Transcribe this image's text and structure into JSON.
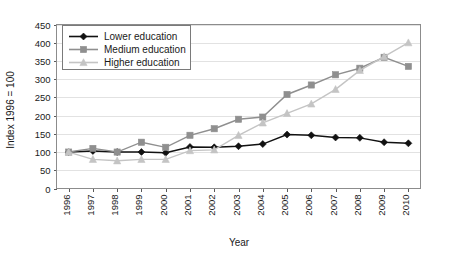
{
  "chart_data": {
    "type": "line",
    "title": "",
    "xlabel": "Year",
    "ylabel": "Index 1996 = 100",
    "categories": [
      "1996",
      "1997",
      "1998",
      "1999",
      "2000",
      "2001",
      "2002",
      "2003",
      "2004",
      "2005",
      "2006",
      "2007",
      "2008",
      "2009",
      "2010"
    ],
    "x": [
      1996,
      1997,
      1998,
      1999,
      2000,
      2001,
      2002,
      2003,
      2004,
      2005,
      2006,
      2007,
      2008,
      2009,
      2010
    ],
    "ylim": [
      0,
      450
    ],
    "yticks": [
      0,
      50,
      100,
      150,
      200,
      250,
      300,
      350,
      400,
      450
    ],
    "grid": true,
    "legend_position": "top-left",
    "series": [
      {
        "name": "Lower education",
        "color": "#111111",
        "marker": "diamond",
        "values": [
          100,
          103,
          100,
          100,
          98,
          114,
          113,
          116,
          122,
          148,
          146,
          140,
          139,
          127,
          124
        ]
      },
      {
        "name": "Medium education",
        "color": "#8f8f8f",
        "marker": "square",
        "values": [
          100,
          110,
          100,
          127,
          113,
          146,
          164,
          190,
          196,
          258,
          284,
          312,
          330,
          360,
          335
        ]
      },
      {
        "name": "Higher education",
        "color": "#c4c4c4",
        "marker": "triangle",
        "values": [
          100,
          80,
          76,
          80,
          80,
          104,
          106,
          146,
          180,
          206,
          232,
          272,
          324,
          362,
          400
        ]
      }
    ]
  },
  "legend": {
    "items": [
      {
        "label": "Lower education"
      },
      {
        "label": "Medium education"
      },
      {
        "label": "Higher education"
      }
    ]
  },
  "axes": {
    "y_title": "Index 1996 = 100",
    "x_title": "Year"
  }
}
